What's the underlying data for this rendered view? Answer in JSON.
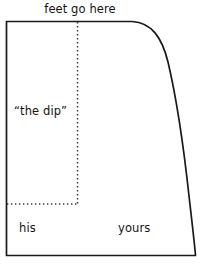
{
  "figure": {
    "kind": "diagram",
    "background_color": "#ffffff",
    "stroke_color": "#1a1a1a",
    "dotted_color": "#3a3a3a",
    "outline": {
      "left_x": 6,
      "top_y": 21,
      "bottom_y": 256,
      "straight_top_end_x": 132,
      "curve_end_x": 196,
      "description": "tapered rectangle with rounded upper-right corner curving down to lower right"
    },
    "dotted_vertical": {
      "x": 77,
      "y_start": 22,
      "y_end": 204,
      "style": "dotted"
    },
    "dotted_horizontal": {
      "y": 204,
      "x_start": 7,
      "x_end": 78,
      "style": "dotted"
    }
  },
  "labels": {
    "top": "feet go here",
    "dip": "“the dip”",
    "left_region": "his",
    "right_region": "yours",
    "bottom_cropped": ""
  }
}
